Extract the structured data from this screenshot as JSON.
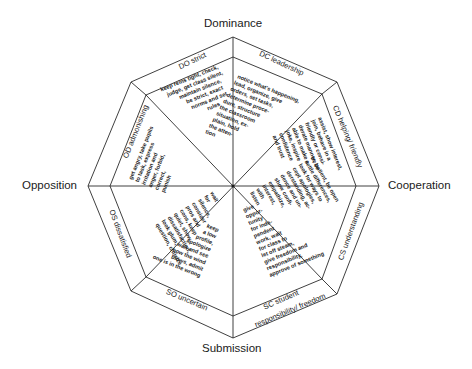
{
  "axes": {
    "top": "Dominance",
    "right": "Cooperation",
    "bottom": "Submission",
    "left": "Opposition"
  },
  "sectors": [
    {
      "code": "DC",
      "ring_label": "DC leadership",
      "behaviours": [
        "notice what's happening,",
        "lead, organize, give",
        "orders, set tasks,",
        "determine proce-",
        "dure, structure",
        "the classroom",
        "situation, ex-",
        "plain, hold",
        "the atten-",
        "tion"
      ]
    },
    {
      "code": "CD",
      "ring_label": "CD helping/ friendly",
      "behaviours": [
        "assist, show interest,",
        "join, behave in a",
        "friendly or consi-",
        "derate manner, be",
        "able to make a",
        "joke, inspire",
        "confidence",
        "and trust"
      ]
    },
    {
      "code": "CS",
      "ring_label": "CS understanding",
      "behaviours": [
        "listen",
        "with",
        "interest,",
        "empathize,",
        "show confi-",
        "dence and un-",
        "derstanding, ac-",
        "cept apologies,",
        "look for ways to",
        "settle differences,",
        "be patient, be open"
      ]
    },
    {
      "code": "SC",
      "ring_label": "SC student responsibility/ freedom",
      "ring_label_lines": [
        "SC student",
        "responsibility/ freedom"
      ],
      "behaviours": [
        "give",
        "oppor-",
        "tunity",
        "for inde-",
        "pendent",
        "work, wait",
        "for class to",
        "let off steam,",
        "give freedom and",
        "responsibility,",
        "approve of something"
      ]
    },
    {
      "code": "SO",
      "ring_label": "SO uncertain",
      "behaviours": [
        "keep",
        "a low",
        "profile,",
        "apologize",
        "wait and see",
        "how the wind",
        "blows, admit",
        "one is in the wrong"
      ]
    },
    {
      "code": "OS",
      "ring_label": "OS dissatisfied",
      "behaviours": [
        "wait",
        "for",
        "silence,",
        "consider",
        "pros and",
        "cons, keep",
        "quiet, show",
        "dissatisfaction,",
        "look glum,",
        "question, criticize"
      ]
    },
    {
      "code": "OD",
      "ring_label": "OD admonishing",
      "behaviours": [
        "get angry, take pupils",
        "to task, express",
        "irritation and",
        "anger, forbid,",
        "correct,",
        "punish"
      ]
    },
    {
      "code": "DO",
      "ring_label": "DO strict",
      "behaviours": [
        "keep reins tight, check,",
        "judge, get class silent,",
        "maintain silence,",
        "be strict, exact",
        "norms and set",
        "rules"
      ]
    }
  ],
  "colors": {
    "line": "#2a2a2a",
    "text": "#1a1a1a",
    "background": "#ffffff"
  }
}
